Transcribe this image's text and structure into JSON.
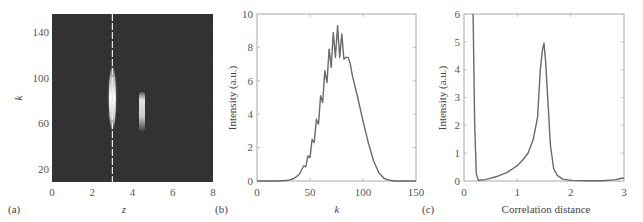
{
  "chart_data": [
    {
      "panel": "(a)",
      "type": "heatmap",
      "title": "",
      "xlabel": "z",
      "ylabel": "k",
      "xlim": [
        0,
        8
      ],
      "ylim": [
        8,
        155
      ],
      "xticks": [
        0,
        2,
        4,
        6,
        8
      ],
      "yticks": [
        20,
        60,
        100,
        140
      ],
      "background_color": "#2a2a2a",
      "dashed_line": {
        "z": 3.0,
        "color": "#e8e8e8",
        "style": "dashed"
      },
      "features": [
        {
          "name": "bright streak",
          "z": 3.0,
          "k_range": [
            55,
            110
          ],
          "peak_k": 85,
          "intensity": "high"
        },
        {
          "name": "bright spot",
          "z": 4.5,
          "k_range": [
            62,
            88
          ],
          "peak_k": 78,
          "intensity": "medium"
        }
      ]
    },
    {
      "panel": "(b)",
      "type": "line",
      "title": "",
      "xlabel": "k",
      "ylabel": "Intensity (a.u.)",
      "xlim": [
        0,
        150
      ],
      "ylim": [
        0,
        10
      ],
      "xticks": [
        0,
        50,
        100,
        150
      ],
      "yticks": [
        0,
        2,
        4,
        6,
        8,
        10
      ],
      "grid": false,
      "series": [
        {
          "name": "spectrum",
          "x": [
            0,
            20,
            30,
            35,
            40,
            44,
            46,
            48,
            50,
            52,
            54,
            56,
            58,
            60,
            62,
            64,
            66,
            68,
            70,
            72,
            74,
            76,
            78,
            80,
            82,
            84,
            86,
            88,
            90,
            95,
            100,
            105,
            110,
            115,
            120,
            125,
            130,
            140,
            150
          ],
          "values": [
            0,
            0,
            0.05,
            0.15,
            0.4,
            0.9,
            0.85,
            1.5,
            1.4,
            2.5,
            2.3,
            3.7,
            3.4,
            5.1,
            4.7,
            6.6,
            5.9,
            7.9,
            6.8,
            8.9,
            7.4,
            9.3,
            7.4,
            8.8,
            7.3,
            7.4,
            7.4,
            7.0,
            6.3,
            5.0,
            3.6,
            2.3,
            1.2,
            0.5,
            0.15,
            0.04,
            0,
            0,
            0
          ]
        }
      ]
    },
    {
      "panel": "(c)",
      "type": "line",
      "title": "",
      "xlabel": "Correlation distance",
      "ylabel": "Intensity (a.u.)",
      "xlim": [
        0,
        3
      ],
      "ylim": [
        0,
        6
      ],
      "xticks": [
        0,
        1,
        2,
        3
      ],
      "yticks": [
        0,
        1,
        2,
        3,
        4,
        5,
        6
      ],
      "grid": false,
      "series": [
        {
          "name": "correlation",
          "x": [
            0.17,
            0.2,
            0.23,
            0.27,
            0.4,
            0.6,
            0.8,
            1.0,
            1.1,
            1.2,
            1.3,
            1.38,
            1.43,
            1.47,
            1.5,
            1.53,
            1.57,
            1.62,
            1.68,
            1.75,
            1.85,
            2.0,
            2.3,
            2.6,
            2.85,
            2.95,
            3.0
          ],
          "values": [
            6.0,
            2.0,
            0.25,
            0.03,
            0.05,
            0.15,
            0.3,
            0.55,
            0.75,
            1.0,
            1.5,
            2.3,
            4.0,
            4.7,
            4.95,
            4.3,
            3.0,
            1.3,
            0.45,
            0.2,
            0.07,
            0.02,
            0.01,
            0.01,
            0.05,
            0.1,
            0.1
          ]
        }
      ]
    }
  ],
  "panels": {
    "a": {
      "label": "(a)",
      "xlabel": "z",
      "ylabel": "k",
      "xticks": [
        "0",
        "2",
        "4",
        "6",
        "8"
      ],
      "yticks": [
        "20",
        "60",
        "100",
        "140"
      ]
    },
    "b": {
      "label": "(b)",
      "xlabel": "k",
      "ylabel": "Intensity (a.u.)",
      "xticks": [
        "0",
        "50",
        "100",
        "150"
      ],
      "yticks": [
        "0",
        "2",
        "4",
        "6",
        "8",
        "10"
      ]
    },
    "c": {
      "label": "(c)",
      "xlabel": "Correlation distance",
      "ylabel": "Intensity (a.u.)",
      "xticks": [
        "0",
        "1",
        "2",
        "3"
      ],
      "yticks": [
        "0",
        "1",
        "2",
        "3",
        "4",
        "5",
        "6"
      ]
    }
  },
  "colors": {
    "line": "#666666",
    "axis": "#999999",
    "heatmap_bg": "#2a2a2a",
    "dash": "#e0e0e0"
  }
}
